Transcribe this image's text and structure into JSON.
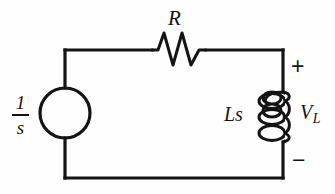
{
  "diagram": {
    "background_color": "#fefefe",
    "line_color": "#141414",
    "labels": {
      "resistor": "R",
      "inductor": "Ls",
      "inductor_voltage": "V",
      "inductor_voltage_subscript": "L",
      "source_numerator": "1",
      "source_denominator": "s",
      "polarity_positive": "+",
      "polarity_negative": "−"
    },
    "components": [
      {
        "name": "voltage-source",
        "symbol": "circle",
        "label": "1/s",
        "position": "left-branch",
        "center_x": 65,
        "center_y": 113,
        "radius": 25
      },
      {
        "name": "resistor",
        "symbol": "zigzag",
        "label": "R",
        "position": "top-branch",
        "x_start": 152,
        "x_end": 206,
        "y": 50
      },
      {
        "name": "inductor",
        "symbol": "coil",
        "label": "Ls",
        "position": "right-branch",
        "loops": 3,
        "x": 283,
        "y_start": 92,
        "y_end": 142
      }
    ],
    "nodes": {
      "top_left_x": 65,
      "top_y": 50,
      "bottom_y": 178,
      "right_x": 283
    }
  }
}
